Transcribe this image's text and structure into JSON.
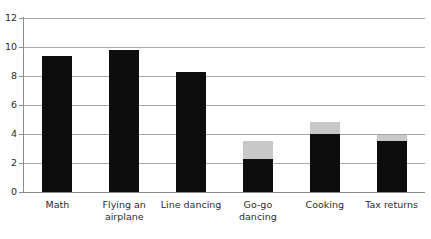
{
  "chart_data": {
    "type": "bar",
    "stacked": true,
    "title": "",
    "xlabel": "",
    "ylabel": "",
    "ylim": [
      0,
      12
    ],
    "yticks": [
      0,
      2,
      4,
      6,
      8,
      10,
      12
    ],
    "ytick_labels": [
      "0",
      "2",
      "4",
      "6",
      "8",
      "10",
      "12"
    ],
    "grid": true,
    "legend": "none",
    "categories": [
      "Math",
      "Flying an airplane",
      "Line dancing",
      "Go-go dancing",
      "Cooking",
      "Tax returns"
    ],
    "series": [
      {
        "name": "primary",
        "color": "#0d0d0d",
        "values": [
          9.35,
          9.8,
          8.3,
          2.3,
          4.0,
          3.5
        ]
      },
      {
        "name": "secondary",
        "color": "#c8c8c8",
        "values": [
          0,
          0,
          0,
          1.25,
          0.8,
          0.4
        ]
      }
    ],
    "totals": [
      9.35,
      9.8,
      8.3,
      3.55,
      4.8,
      3.9
    ]
  },
  "axes": {
    "y_labels": [
      "12",
      "10",
      "8",
      "6",
      "4",
      "2",
      "0"
    ],
    "x_labels": [
      {
        "line1": "Math",
        "line2": ""
      },
      {
        "line1": "Flying an",
        "line2": "airplane"
      },
      {
        "line1": "Line dancing",
        "line2": ""
      },
      {
        "line1": "Go-go",
        "line2": "dancing"
      },
      {
        "line1": "Cooking",
        "line2": ""
      },
      {
        "line1": "Tax returns",
        "line2": ""
      }
    ]
  },
  "colors": {
    "primary_bar": "#0d0d0d",
    "secondary_bar": "#c8c8c8",
    "gridline": "#a9a9a9",
    "axis": "#8c8c8c",
    "text": "#2b2b2b",
    "background": "#ffffff"
  }
}
